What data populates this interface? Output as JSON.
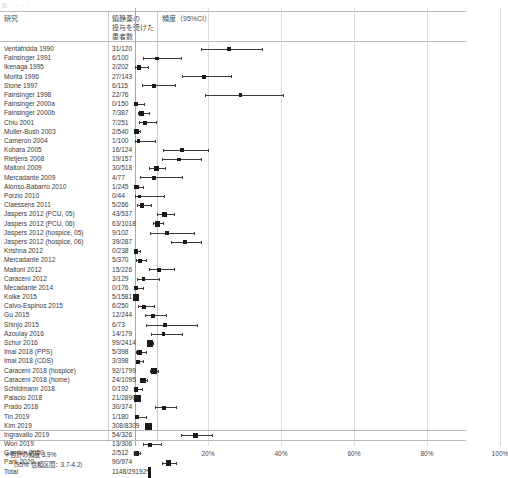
{
  "top_strip_text": "図  ・・・・",
  "header": {
    "study_col": "研究",
    "n_col": "鎮静薬の\n投与を受けた\n患者数",
    "effect_col": "頻度（95%CI）"
  },
  "footnote": {
    "line1": "＊合計の頻度 3.9%",
    "line2": "（95% 信頼区間：3.7-4.2）"
  },
  "axis": {
    "ticks": [
      "0",
      "20%",
      "40%",
      "60%",
      "80%",
      "100%"
    ],
    "tick_values": [
      0,
      20,
      40,
      60,
      80,
      100
    ],
    "xmin": 0,
    "xmax": 105
  },
  "chart_data": {
    "type": "forest",
    "title": "",
    "xlabel": "",
    "ylabel": "",
    "xlim": [
      0,
      105
    ],
    "grid": true,
    "columns": [
      "研究",
      "鎮静薬の投与を受けた患者数",
      "頻度（95%CI）"
    ],
    "summary": {
      "label": "Total",
      "n": "1148/29192*",
      "pct": 3.9,
      "ci_low": 3.7,
      "ci_high": 4.2
    },
    "rows": [
      {
        "study": "Ventafridda 1990",
        "n": "31/120",
        "pct": 25.8,
        "ci_low": 18.2,
        "ci_high": 34.7,
        "weight": 1.0
      },
      {
        "study": "Fainsinger 1991",
        "n": "6/100",
        "pct": 6.0,
        "ci_low": 2.2,
        "ci_high": 12.6,
        "weight": 0.9
      },
      {
        "study": "Ikenaga 1995",
        "n": "2/202",
        "pct": 1.0,
        "ci_low": 0.1,
        "ci_high": 3.5,
        "weight": 1.2
      },
      {
        "study": "Morita 1996",
        "n": "27/143",
        "pct": 18.9,
        "ci_low": 12.8,
        "ci_high": 26.3,
        "weight": 1.1
      },
      {
        "study": "Stone 1997",
        "n": "6/115",
        "pct": 5.2,
        "ci_low": 1.9,
        "ci_high": 11.0,
        "weight": 1.0
      },
      {
        "study": "Fainsinger 1998",
        "n": "22/76",
        "pct": 28.9,
        "ci_low": 19.1,
        "ci_high": 40.5,
        "weight": 0.8
      },
      {
        "study": "Fainsinger 2000a",
        "n": "0/150",
        "pct": 0.3,
        "ci_low": 0.0,
        "ci_high": 2.4,
        "weight": 1.1
      },
      {
        "study": "Fainsinger 2000b",
        "n": "7/387",
        "pct": 1.8,
        "ci_low": 0.7,
        "ci_high": 3.7,
        "weight": 1.4
      },
      {
        "study": "Chiu 2001",
        "n": "7/251",
        "pct": 2.8,
        "ci_low": 1.1,
        "ci_high": 5.7,
        "weight": 1.3
      },
      {
        "study": "Muller-Bush 2003",
        "n": "2/540",
        "pct": 0.4,
        "ci_low": 0.0,
        "ci_high": 1.3,
        "weight": 1.7
      },
      {
        "study": "Cameron 2004",
        "n": "1/100",
        "pct": 1.0,
        "ci_low": 0.0,
        "ci_high": 5.4,
        "weight": 0.9
      },
      {
        "study": "Kohara 2005",
        "n": "16/124",
        "pct": 12.9,
        "ci_low": 7.6,
        "ci_high": 20.1,
        "weight": 1.0
      },
      {
        "study": "Rietjens 2008",
        "n": "19/157",
        "pct": 12.1,
        "ci_low": 7.4,
        "ci_high": 18.2,
        "weight": 1.1
      },
      {
        "study": "Maltoni 2009",
        "n": "30/518",
        "pct": 5.8,
        "ci_low": 3.9,
        "ci_high": 8.2,
        "weight": 1.7
      },
      {
        "study": "Mercadante 2009",
        "n": "4/77",
        "pct": 5.2,
        "ci_low": 1.4,
        "ci_high": 12.8,
        "weight": 0.8
      },
      {
        "study": "Alonso-Babarro 2010",
        "n": "1/245",
        "pct": 0.4,
        "ci_low": 0.0,
        "ci_high": 2.2,
        "weight": 1.3
      },
      {
        "study": "Porzio 2010",
        "n": "0/44",
        "pct": 1.1,
        "ci_low": 0.0,
        "ci_high": 8.0,
        "weight": 0.6
      },
      {
        "study": "Claessens 2011",
        "n": "5/266",
        "pct": 1.9,
        "ci_low": 0.6,
        "ci_high": 4.3,
        "weight": 1.3
      },
      {
        "study": "Jaspers 2012 (PCU, 05)",
        "n": "43/537",
        "pct": 8.0,
        "ci_low": 5.9,
        "ci_high": 10.6,
        "weight": 1.7
      },
      {
        "study": "Jaspers 2012 (PCU, 06)",
        "n": "63/1018",
        "pct": 6.2,
        "ci_low": 4.8,
        "ci_high": 7.8,
        "weight": 2.1
      },
      {
        "study": "Jaspers 2012 (hospice, 05)",
        "n": "9/102",
        "pct": 8.8,
        "ci_low": 4.1,
        "ci_high": 16.1,
        "weight": 0.9
      },
      {
        "study": "Jaspers 2012 (hospice, 06)",
        "n": "39/287",
        "pct": 13.6,
        "ci_low": 9.9,
        "ci_high": 18.1,
        "weight": 1.3
      },
      {
        "study": "Krishna 2012",
        "n": "0/238",
        "pct": 0.2,
        "ci_low": 0.0,
        "ci_high": 1.5,
        "weight": 1.3
      },
      {
        "study": "Mercadante 2012",
        "n": "5/370",
        "pct": 1.4,
        "ci_low": 0.4,
        "ci_high": 3.1,
        "weight": 1.4
      },
      {
        "study": "Maltoni 2012",
        "n": "15/226",
        "pct": 6.6,
        "ci_low": 3.8,
        "ci_high": 10.7,
        "weight": 1.2
      },
      {
        "study": "Caraceni 2012",
        "n": "3/129",
        "pct": 2.3,
        "ci_low": 0.5,
        "ci_high": 6.6,
        "weight": 1.0
      },
      {
        "study": "Mecadante 2014",
        "n": "0/176",
        "pct": 0.3,
        "ci_low": 0.0,
        "ci_high": 2.1,
        "weight": 1.2
      },
      {
        "study": "Koike 2015",
        "n": "5/1581",
        "pct": 0.3,
        "ci_low": 0.1,
        "ci_high": 0.7,
        "weight": 2.4
      },
      {
        "study": "Calvo-Espinos 2015",
        "n": "6/250",
        "pct": 2.4,
        "ci_low": 0.9,
        "ci_high": 5.2,
        "weight": 1.3
      },
      {
        "study": "Gu 2015",
        "n": "12/244",
        "pct": 4.9,
        "ci_low": 2.6,
        "ci_high": 8.4,
        "weight": 1.3
      },
      {
        "study": "Shinjo 2015",
        "n": "6/73",
        "pct": 8.2,
        "ci_low": 3.1,
        "ci_high": 17.0,
        "weight": 0.8
      },
      {
        "study": "Azoulay 2016",
        "n": "14/179",
        "pct": 7.8,
        "ci_low": 4.3,
        "ci_high": 12.8,
        "weight": 1.1
      },
      {
        "study": "Schur 2016",
        "n": "99/2414",
        "pct": 4.1,
        "ci_low": 3.3,
        "ci_high": 5.0,
        "weight": 2.5
      },
      {
        "study": "Imai 2018 (PPS)",
        "n": "5/398",
        "pct": 1.3,
        "ci_low": 0.4,
        "ci_high": 2.9,
        "weight": 1.5
      },
      {
        "study": "Imai 2018 (CDS)",
        "n": "3/398",
        "pct": 0.8,
        "ci_low": 0.2,
        "ci_high": 2.2,
        "weight": 1.5
      },
      {
        "study": "Caraceni 2018 (hospice)",
        "n": "92/1799",
        "pct": 5.1,
        "ci_low": 4.1,
        "ci_high": 6.2,
        "weight": 2.3
      },
      {
        "study": "Caraceni 2018 (home)",
        "n": "24/1095",
        "pct": 2.2,
        "ci_low": 1.4,
        "ci_high": 3.2,
        "weight": 2.1
      },
      {
        "study": "Schildmann 2018",
        "n": "0/192",
        "pct": 0.3,
        "ci_low": 0.0,
        "ci_high": 1.9,
        "weight": 1.2
      },
      {
        "study": "Palacio 2018",
        "n": "21/2890",
        "pct": 0.7,
        "ci_low": 0.4,
        "ci_high": 1.1,
        "weight": 2.7
      },
      {
        "study": "Prado 2018",
        "n": "30/374",
        "pct": 8.0,
        "ci_low": 5.5,
        "ci_high": 11.2,
        "weight": 1.4
      },
      {
        "study": "Tin 2019",
        "n": "1/180",
        "pct": 0.6,
        "ci_low": 0.0,
        "ci_high": 3.1,
        "weight": 1.2
      },
      {
        "study": "Kim 2019",
        "n": "308/8309",
        "pct": 3.7,
        "ci_low": 3.3,
        "ci_high": 4.1,
        "weight": 3.0
      },
      {
        "study": "Ingravallo 2019",
        "n": "54/326",
        "pct": 16.6,
        "ci_low": 12.7,
        "ci_high": 21.0,
        "weight": 1.3
      },
      {
        "study": "Won 2019",
        "n": "13/306",
        "pct": 4.2,
        "ci_low": 2.3,
        "ci_high": 7.1,
        "weight": 1.3
      },
      {
        "study": "Gambin 2020",
        "n": "2/512",
        "pct": 0.4,
        "ci_low": 0.0,
        "ci_high": 1.4,
        "weight": 1.7
      },
      {
        "study": "Park 2020",
        "n": "90/974",
        "pct": 9.2,
        "ci_low": 7.5,
        "ci_high": 11.2,
        "weight": 2.0
      }
    ]
  }
}
